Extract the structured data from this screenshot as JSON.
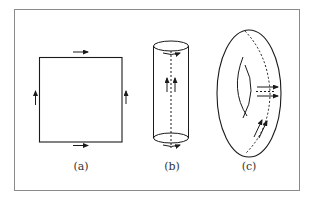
{
  "figure": {
    "panels": [
      {
        "id": "a",
        "label": "(a)",
        "shape": "square",
        "description": "Square with edge-identification arrows: top and bottom arrows point right, left and right arrows point up"
      },
      {
        "id": "b",
        "label": "(b)",
        "shape": "cylinder",
        "description": "Cylinder with dashed vertical seam, two upward arrows, circular arrows at top and bottom rims"
      },
      {
        "id": "c",
        "label": "(c)",
        "shape": "torus",
        "description": "Torus with dashed meridian curve, horizontal arrows around the tube and diagonal arrows along the seam"
      }
    ],
    "colors": {
      "stroke": "#1a1a1a",
      "frame": "#8a8a8a",
      "background": "#ffffff",
      "label": "#333333"
    }
  }
}
